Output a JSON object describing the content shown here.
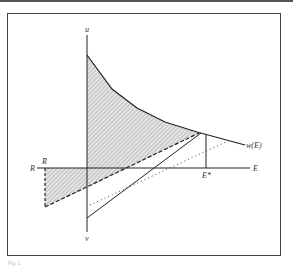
{
  "diagram": {
    "labels": {
      "vertical_axis_top": "u",
      "vertical_axis_bottom": "v",
      "horizontal_axis_left": "R",
      "horizontal_axis_right": "E",
      "r_bar": "R̄",
      "e_star": "E*",
      "curve": "w(E)"
    },
    "caption": "Fig. 1",
    "colors": {
      "line": "#222222",
      "hatch": "#999999",
      "frame": "#444444"
    }
  }
}
